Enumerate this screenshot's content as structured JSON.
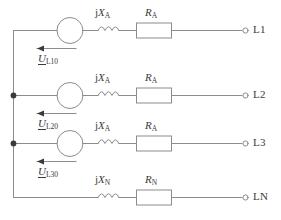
{
  "diagram": {
    "stroke_color": "#8c8c8c",
    "text_color": "#3a3a3a",
    "background": "#ffffff",
    "rows": [
      {
        "id": "L1",
        "terminal_label": "L1",
        "has_source": true,
        "has_junction_dot": false,
        "reactance_prefix": "j",
        "reactance_symbol": "X",
        "reactance_subscript": "A",
        "resistance_symbol": "R",
        "resistance_subscript": "A",
        "phasor_symbol": "U",
        "phasor_subscript": "L10",
        "arrow_direction": "left"
      },
      {
        "id": "L2",
        "terminal_label": "L2",
        "has_source": true,
        "has_junction_dot": true,
        "reactance_prefix": "j",
        "reactance_symbol": "X",
        "reactance_subscript": "A",
        "resistance_symbol": "R",
        "resistance_subscript": "A",
        "phasor_symbol": "U",
        "phasor_subscript": "L20",
        "arrow_direction": "left"
      },
      {
        "id": "L3",
        "terminal_label": "L3",
        "has_source": true,
        "has_junction_dot": true,
        "reactance_prefix": "j",
        "reactance_symbol": "X",
        "reactance_subscript": "A",
        "resistance_symbol": "R",
        "resistance_subscript": "A",
        "phasor_symbol": "U",
        "phasor_subscript": "L30",
        "arrow_direction": "left"
      },
      {
        "id": "LN",
        "terminal_label": "LN",
        "has_source": false,
        "has_junction_dot": false,
        "reactance_prefix": "j",
        "reactance_symbol": "X",
        "reactance_subscript": "N",
        "resistance_symbol": "R",
        "resistance_subscript": "N",
        "phasor_symbol": null,
        "phasor_subscript": null,
        "arrow_direction": null
      }
    ]
  }
}
